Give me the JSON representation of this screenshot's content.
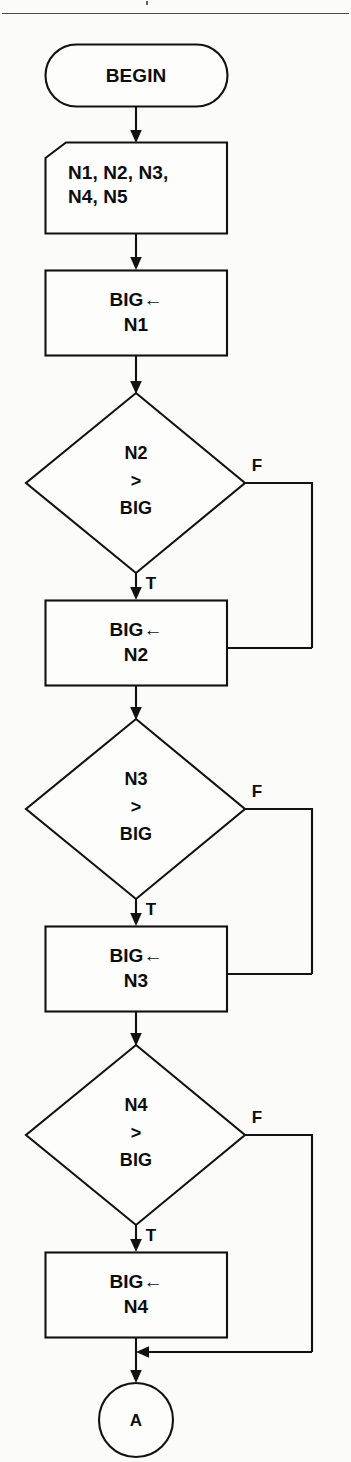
{
  "figure": {
    "kind": "flowchart",
    "colors": {
      "page_background": "#fbfbf9",
      "line": "#121212",
      "shape_fill": "#fdfdfb",
      "rule": "#4a4a4a"
    }
  },
  "nodes": {
    "terminator_begin": {
      "shape": "stadium",
      "label": "BEGIN"
    },
    "input_numbers": {
      "shape": "manual-input",
      "line1": "N1, N2, N3,",
      "line2": "N4, N5"
    },
    "assign_big_n1": {
      "shape": "process",
      "line1": "BIG←",
      "line2": "N1"
    },
    "decision_n2": {
      "shape": "decision",
      "line1": "N2",
      "line2": ">",
      "line3": "BIG"
    },
    "assign_big_n2": {
      "shape": "process",
      "line1": "BIG←",
      "line2": "N2"
    },
    "decision_n3": {
      "shape": "decision",
      "line1": "N3",
      "line2": ">",
      "line3": "BIG"
    },
    "assign_big_n3": {
      "shape": "process",
      "line1": "BIG←",
      "line2": "N3"
    },
    "decision_n4": {
      "shape": "decision",
      "line1": "N4",
      "line2": ">",
      "line3": "BIG"
    },
    "assign_big_n4": {
      "shape": "process",
      "line1": "BIG←",
      "line2": "N4"
    },
    "connector_a": {
      "shape": "circle",
      "label": "A"
    }
  },
  "branch_labels": {
    "n2_false": "F",
    "n2_true": "T",
    "n3_false": "F",
    "n3_true": "T",
    "n4_false": "F",
    "n4_true": "T"
  }
}
